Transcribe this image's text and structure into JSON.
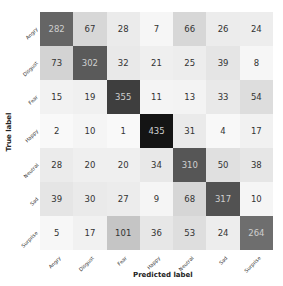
{
  "chart_data": {
    "type": "heatmap",
    "title": "",
    "xlabel": "Predicted label",
    "ylabel": "True label",
    "colormap": "Greys",
    "vmin": 0,
    "vmax": 435,
    "x_tick_labels": [
      "Angry",
      "Disgust",
      "Fear",
      "Happy",
      "Neutral",
      "Sad",
      "Surprise"
    ],
    "y_tick_labels": [
      "Angry",
      "Disgust",
      "Fear",
      "Happy",
      "Neutral",
      "Sad",
      "Surprise"
    ],
    "matrix": [
      [
        282,
        67,
        28,
        7,
        66,
        26,
        24
      ],
      [
        73,
        302,
        32,
        21,
        25,
        39,
        8
      ],
      [
        15,
        19,
        355,
        11,
        13,
        33,
        54
      ],
      [
        2,
        10,
        1,
        435,
        31,
        4,
        17
      ],
      [
        28,
        20,
        20,
        34,
        310,
        50,
        38
      ],
      [
        39,
        30,
        27,
        9,
        68,
        317,
        10
      ],
      [
        5,
        17,
        101,
        36,
        53,
        24,
        264
      ]
    ],
    "grid": false,
    "legend": "none"
  }
}
